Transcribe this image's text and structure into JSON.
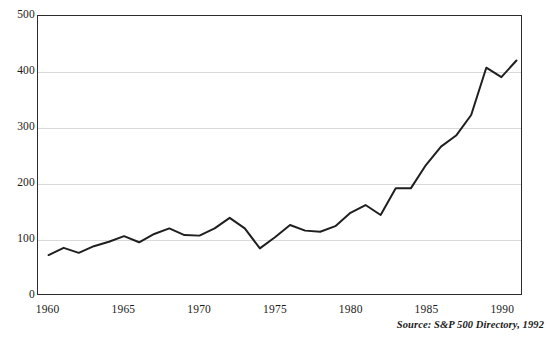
{
  "chart_data": {
    "type": "line",
    "title": "",
    "subtitle": "",
    "xlabel": "",
    "ylabel": "",
    "xlim": [
      1959.3,
      1991.3
    ],
    "ylim": [
      0,
      500
    ],
    "grid": true,
    "legend": "none",
    "source_note": "Source: S&P 500 Directory, 1992",
    "y_ticks": [
      {
        "value": 500,
        "label": "500"
      },
      {
        "value": 400,
        "label": "400"
      },
      {
        "value": 300,
        "label": "300"
      },
      {
        "value": 200,
        "label": "200"
      },
      {
        "value": 100,
        "label": "100"
      },
      {
        "value": 0,
        "label": "0"
      }
    ],
    "x_ticks": [
      {
        "value": 1960,
        "label": "1960"
      },
      {
        "value": 1965,
        "label": "1965"
      },
      {
        "value": 1970,
        "label": "1970"
      },
      {
        "value": 1975,
        "label": "1975"
      },
      {
        "value": 1980,
        "label": "1980"
      },
      {
        "value": 1985,
        "label": "1985"
      },
      {
        "value": 1990,
        "label": "1990"
      }
    ],
    "series": [
      {
        "name": "S&P 500 Index",
        "color": "#1f1f1f",
        "x": [
          1960,
          1961,
          1962,
          1963,
          1964,
          1965,
          1966,
          1967,
          1968,
          1969,
          1970,
          1971,
          1972,
          1973,
          1974,
          1975,
          1976,
          1977,
          1978,
          1979,
          1980,
          1981,
          1982,
          1983,
          1984,
          1985,
          1986,
          1987,
          1988,
          1989,
          1990,
          1991
        ],
        "values": [
          70,
          83,
          74,
          86,
          94,
          104,
          93,
          108,
          118,
          106,
          105,
          118,
          137,
          118,
          82,
          102,
          124,
          114,
          112,
          122,
          146,
          160,
          142,
          190,
          190,
          232,
          265,
          285,
          322,
          407,
          390,
          420
        ]
      }
    ]
  }
}
